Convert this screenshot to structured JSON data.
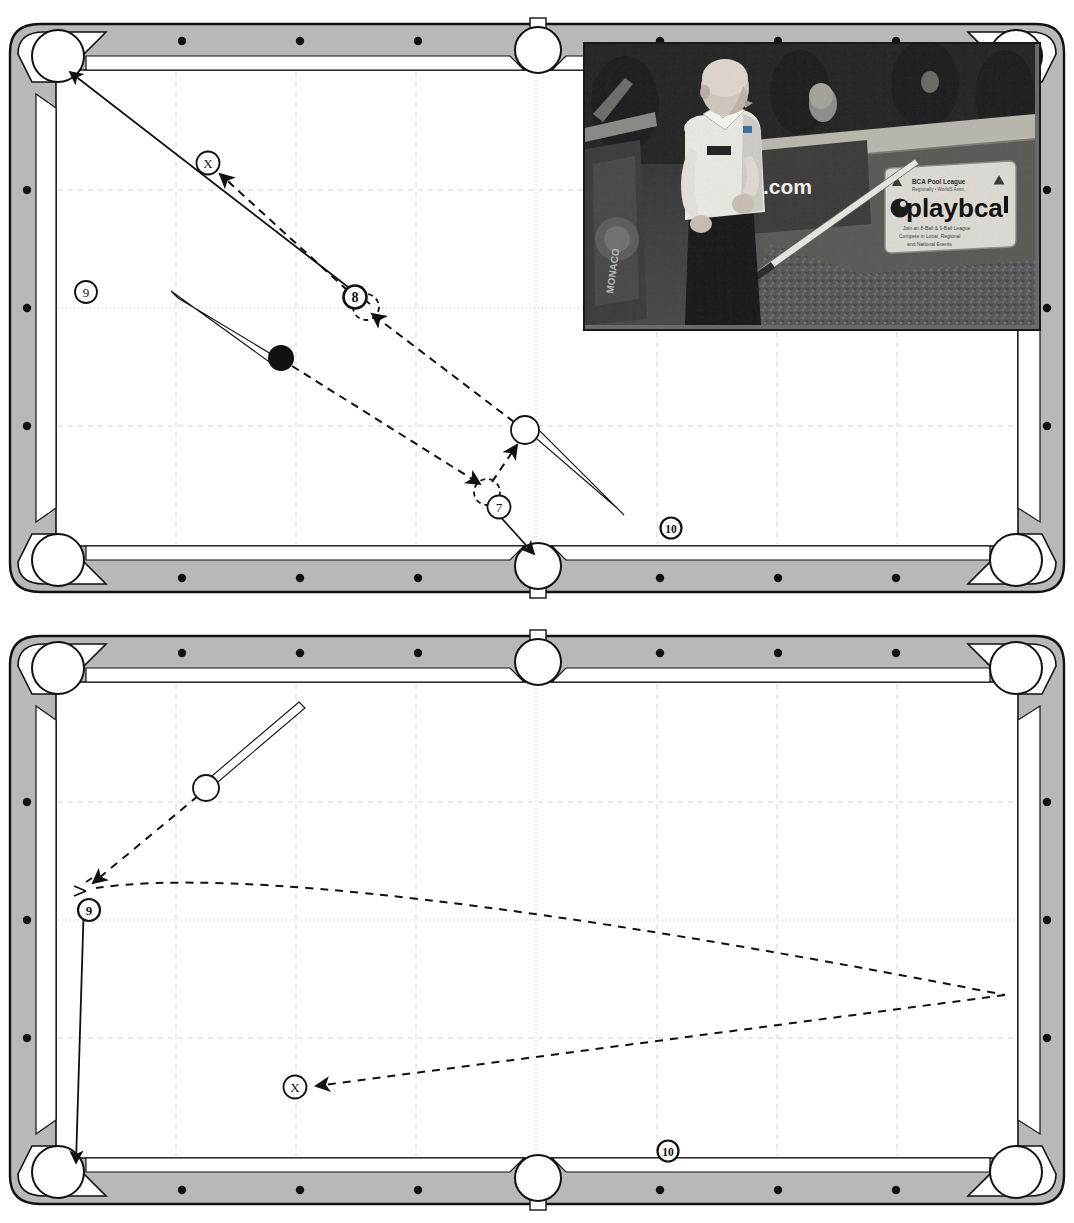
{
  "document": {
    "kind": "billiards-instruction-diagram",
    "figure_count": 2
  },
  "diagrams": [
    {
      "id": "diagram-top",
      "name": "top-pool-table-diagram",
      "ball_labels": [
        {
          "text": "X",
          "x": 208,
          "y": 155,
          "desc": "cue-ball-target-position-marker"
        },
        {
          "text": "8",
          "x": 355,
          "y": 289,
          "desc": "eight-ball-label"
        },
        {
          "text": "9",
          "x": 86,
          "y": 284,
          "desc": "nine-ball-label"
        },
        {
          "text": "7",
          "x": 499,
          "y": 499,
          "desc": "seven-ball-label"
        },
        {
          "text": "10",
          "x": 671,
          "y": 520,
          "desc": "ten-ball-label"
        }
      ],
      "objects": [
        {
          "type": "solid-ball",
          "x": 281,
          "y": 350,
          "r": 13,
          "desc": "object-ball-solid-black"
        },
        {
          "type": "cue-ball",
          "x": 525,
          "y": 422,
          "r": 14,
          "desc": "cue-ball-open-circle"
        },
        {
          "type": "ghost-ball",
          "x": 366,
          "y": 299,
          "r": 13,
          "desc": "ghost-ball-position-eight"
        },
        {
          "type": "ghost-ball",
          "x": 487,
          "y": 484,
          "r": 13,
          "desc": "ghost-ball-position-seven"
        }
      ],
      "cue_sticks": [
        {
          "x1": 175,
          "y1": 287,
          "x2": 278,
          "y2": 350,
          "desc": "cue-stick-aiming-at-solid-ball"
        },
        {
          "x1": 620,
          "y1": 502,
          "x2": 532,
          "y2": 428,
          "desc": "cue-stick-aiming-at-cue-ball"
        }
      ],
      "solid_paths": [
        {
          "desc": "object-ball-path-to-upper-left-corner-pocket",
          "from": [
            366,
            299
          ],
          "to": [
            63,
            57
          ]
        },
        {
          "desc": "seven-ball-path-to-bottom-side-pocket",
          "from": [
            490,
            490
          ],
          "to": [
            538,
            552
          ]
        }
      ],
      "dashed_paths": [
        {
          "desc": "cue-ball-path-after-contact-toward-X",
          "points": [
            [
              525,
              422
            ],
            [
              366,
              299
            ],
            [
              215,
              160
            ]
          ]
        },
        {
          "desc": "cue-ball-travel-from-solid-ball",
          "points": [
            [
              281,
              350
            ],
            [
              487,
              484
            ]
          ]
        }
      ]
    },
    {
      "id": "diagram-bottom",
      "name": "bottom-pool-table-diagram",
      "ball_labels": [
        {
          "text": "9",
          "x": 89,
          "y": 901,
          "desc": "nine-ball-label"
        },
        {
          "text": "X",
          "x": 295,
          "y": 1078,
          "desc": "cue-ball-target-position-marker"
        },
        {
          "text": "10",
          "x": 668,
          "y": 1142,
          "desc": "ten-ball-label"
        }
      ],
      "objects": [
        {
          "type": "cue-ball",
          "x": 206,
          "y": 779,
          "r": 13,
          "desc": "cue-ball-open-circle"
        },
        {
          "type": "ghost-ball",
          "x": 88,
          "y": 876,
          "r": 10,
          "desc": "ghost-ball-position-nine"
        }
      ],
      "cue_sticks": [
        {
          "x1": 303,
          "y1": 697,
          "x2": 212,
          "y2": 774,
          "desc": "cue-stick-aiming-at-cue-ball"
        }
      ],
      "solid_paths": [
        {
          "desc": "nine-ball-path-down-left-rail-to-corner-pocket",
          "from": [
            84,
            890
          ],
          "to": [
            75,
            1158
          ]
        }
      ],
      "dashed_paths": [
        {
          "desc": "cue-ball-aim-line-to-nine-ball",
          "points": [
            [
              206,
              779
            ],
            [
              92,
              873
            ]
          ]
        },
        {
          "desc": "cue-ball-rail-path-curving-right",
          "points": [
            [
              96,
              879
            ],
            [
              210,
              871
            ],
            [
              1005,
              986
            ]
          ]
        },
        {
          "desc": "cue-ball-rebound-path-to-X",
          "points": [
            [
              1005,
              986
            ],
            [
              310,
              1077
            ]
          ]
        }
      ]
    }
  ],
  "photo": {
    "name": "pool-player-photograph",
    "alt": "Bald pool player in white polo shirt holding a cue beside a pool table at a league event",
    "signage": [
      {
        "text": "BCA Pool League",
        "desc": "sign-heading"
      },
      {
        "text": "playbca",
        "desc": "sign-logo-wordmark"
      },
      {
        "text": ".com",
        "desc": "banner-domain-suffix"
      }
    ],
    "tones": {
      "background": "#3a3a3a",
      "shirt": "#e8e8e6",
      "trousers": "#1c1c1c",
      "sign": "#d9d8d2",
      "table": "#6f6f6f",
      "carpet": "#545454"
    }
  },
  "table_style": {
    "rail_fill": "#b8b8b8",
    "cloth_fill": "#ffffff",
    "outline": "#111111",
    "grid_line": "#cfcfcf",
    "grid_major": "#bdbdbd",
    "pocket_fill": "#ffffff",
    "sight_dot": "#111111"
  }
}
